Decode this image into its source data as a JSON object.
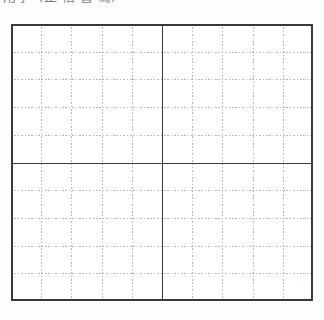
{
  "document": {
    "type": "grid-worksheet",
    "heading": "用字（正 楷 書 寫）",
    "heading_clipped": true,
    "background_color": "#fefefe"
  },
  "grid": {
    "label": "ten-by-ten practice grid",
    "columns": 10,
    "rows": 10,
    "bounds": {
      "left": 11,
      "top": 24,
      "width": 302,
      "height": 277
    },
    "border": {
      "color": "#3a3a3a",
      "width": 1.6,
      "style": "solid"
    },
    "center_lines": {
      "color": "#3a3a3a",
      "width": 1.5,
      "style": "solid",
      "vertical_at_column": 5,
      "horizontal_at_row": 5
    },
    "minor_lines": {
      "color": "#b9b9b9",
      "width": 1,
      "style": "dotted",
      "dash": "1.6 1.8"
    },
    "cells": [
      [
        "",
        "",
        "",
        "",
        "",
        "",
        "",
        "",
        "",
        ""
      ],
      [
        "",
        "",
        "",
        "",
        "",
        "",
        "",
        "",
        "",
        ""
      ],
      [
        "",
        "",
        "",
        "",
        "",
        "",
        "",
        "",
        "",
        ""
      ],
      [
        "",
        "",
        "",
        "",
        "",
        "",
        "",
        "",
        "",
        ""
      ],
      [
        "",
        "",
        "",
        "",
        "",
        "",
        "",
        "",
        "",
        ""
      ],
      [
        "",
        "",
        "",
        "",
        "",
        "",
        "",
        "",
        "",
        ""
      ],
      [
        "",
        "",
        "",
        "",
        "",
        "",
        "",
        "",
        "",
        ""
      ],
      [
        "",
        "",
        "",
        "",
        "",
        "",
        "",
        "",
        "",
        ""
      ],
      [
        "",
        "",
        "",
        "",
        "",
        "",
        "",
        "",
        "",
        ""
      ],
      [
        "",
        "",
        "",
        "",
        "",
        "",
        "",
        "",
        "",
        ""
      ]
    ]
  },
  "chart_data": {
    "type": "table",
    "title": "用字（正 楷 書 寫）",
    "columns": 10,
    "rows": 10,
    "values": [],
    "xlabel": "",
    "ylabel": "",
    "grid": true,
    "legend": "none"
  }
}
